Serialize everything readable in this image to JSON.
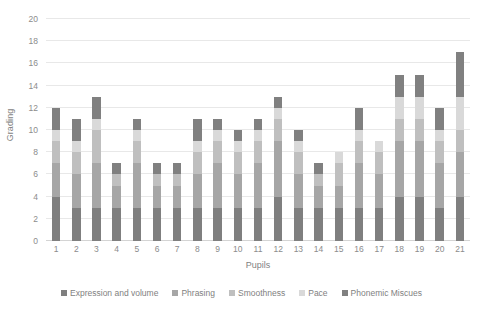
{
  "chart_data": {
    "type": "bar",
    "subtype": "stacked-bar",
    "title": "",
    "xlabel": "Pupils",
    "ylabel": "Grading",
    "ylim": [
      0,
      20
    ],
    "ytick_step": 2,
    "yticks": [
      0,
      2,
      4,
      6,
      8,
      10,
      12,
      14,
      16,
      18,
      20
    ],
    "grid": true,
    "grid_axis": "y",
    "legend_position": "bottom",
    "categories": [
      "1",
      "2",
      "3",
      "4",
      "5",
      "6",
      "7",
      "8",
      "9",
      "10",
      "11",
      "12",
      "13",
      "14",
      "15",
      "16",
      "17",
      "18",
      "19",
      "20",
      "21"
    ],
    "series": [
      {
        "name": "Expression and volume",
        "color": "#7f7f7f",
        "values": [
          4,
          3,
          3,
          3,
          3,
          3,
          3,
          3,
          3,
          3,
          3,
          4,
          3,
          3,
          3,
          3,
          3,
          4,
          4,
          3,
          4
        ]
      },
      {
        "name": "Phrasing",
        "color": "#a6a6a6",
        "values": [
          3,
          3,
          4,
          2,
          4,
          2,
          2,
          3,
          4,
          3,
          4,
          5,
          3,
          2,
          2,
          4,
          3,
          5,
          5,
          4,
          4
        ]
      },
      {
        "name": "Smoothness",
        "color": "#bfbfbf",
        "values": [
          2,
          2,
          3,
          1,
          2,
          1,
          1,
          2,
          2,
          2,
          2,
          2,
          2,
          1,
          2,
          2,
          2,
          2,
          2,
          2,
          2
        ]
      },
      {
        "name": "Pace",
        "color": "#d9d9d9",
        "values": [
          1,
          1,
          1,
          0,
          1,
          0,
          0,
          1,
          1,
          1,
          1,
          1,
          1,
          0,
          1,
          1,
          1,
          2,
          2,
          1,
          3
        ]
      },
      {
        "name": "Phonemic Miscues",
        "color": "#808080",
        "values": [
          2,
          2,
          2,
          1,
          1,
          1,
          1,
          2,
          1,
          1,
          1,
          1,
          1,
          1,
          0,
          2,
          0,
          2,
          2,
          2,
          4
        ]
      }
    ],
    "totals": [
      12,
      11,
      13,
      7,
      11,
      7,
      7,
      11,
      11,
      10,
      11,
      13,
      10,
      7,
      8,
      12,
      9,
      15,
      15,
      12,
      17
    ]
  },
  "axes": {
    "y_title": "Grading",
    "x_title": "Pupils",
    "y_tick_labels": [
      "0",
      "2",
      "4",
      "6",
      "8",
      "10",
      "12",
      "14",
      "16",
      "18",
      "20"
    ],
    "x_tick_labels": [
      "1",
      "2",
      "3",
      "4",
      "5",
      "6",
      "7",
      "8",
      "9",
      "10",
      "11",
      "12",
      "13",
      "14",
      "15",
      "16",
      "17",
      "18",
      "19",
      "20",
      "21"
    ]
  },
  "legend": {
    "items": [
      {
        "label": "Expression and volume",
        "color": "#7f7f7f"
      },
      {
        "label": "Phrasing",
        "color": "#a6a6a6"
      },
      {
        "label": "Smoothness",
        "color": "#bfbfbf"
      },
      {
        "label": "Pace",
        "color": "#d9d9d9"
      },
      {
        "label": "Phonemic Miscues",
        "color": "#808080"
      }
    ]
  },
  "colors": {
    "background": "#ffffff",
    "gridline": "#e8e8e8",
    "baseline": "#d4d4d4",
    "text": "#7f7f7f"
  }
}
